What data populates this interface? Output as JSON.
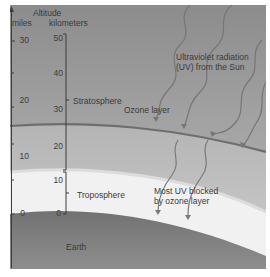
{
  "axis": {
    "title": "Altitude",
    "miles_label": "miles",
    "km_label": "kilometers",
    "miles_ticks": [
      "30",
      "20",
      "10",
      "0"
    ],
    "km_ticks": [
      "50",
      "40",
      "30",
      "20",
      "10",
      "0"
    ]
  },
  "layers": {
    "stratosphere": "Stratosphere",
    "ozone": "Ozone layer",
    "troposphere": "Troposphere",
    "earth": "Earth"
  },
  "annotations": {
    "uv_line1": "Ultraviolet radiation",
    "uv_line2": "(UV) from the Sun",
    "blocked_line1": "Most UV blocked",
    "blocked_line2": "by ozone layer"
  },
  "colors": {
    "upper_sky": "#8f8f8f",
    "stratosphere": "#a8a8a8",
    "ozone_line": "#6e6e6e",
    "troposphere_band": "#f2f2f2",
    "earth": "#7e7e7e",
    "uv_arrows": "#7a7a7a"
  }
}
